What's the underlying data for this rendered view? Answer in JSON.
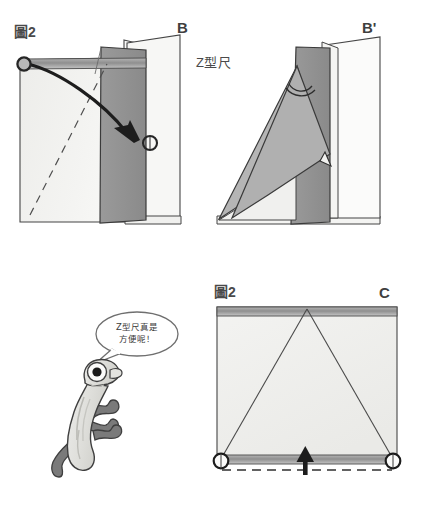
{
  "page": {
    "width": 428,
    "height": 508,
    "background": "#ffffff"
  },
  "labels": {
    "figure_top_left": "圖2",
    "step_b": "B",
    "step_b_prime": "B'",
    "z_ruler": "Z型尺",
    "figure_bottom_right": "圖2",
    "step_c": "C"
  },
  "speech_bubble": {
    "line1": "Z型尺真是",
    "line2": "方便呢！"
  },
  "colors": {
    "outline": "#3a3a3a",
    "paper_light": "#f2f2f0",
    "paper_white": "#fbfbfa",
    "flap_dark": "#8f8f8f",
    "flap_mid": "#a8a8a8",
    "band_gray": "#9a9a9a",
    "band_light": "#c9c9c9",
    "character_body": "#e2e2de",
    "character_leg": "#777777",
    "character_eye": "#1a1a1a",
    "arrow": "#222222"
  },
  "panels": {
    "top_left": {
      "name": "panel-b",
      "markers": [
        "pivot-circle-top-left",
        "pivot-circle-mid-right"
      ],
      "annotations": [
        "curved-rotation-arrow",
        "dashed-diagonal-fold-line",
        "horizontal-gray-band"
      ]
    },
    "top_right": {
      "name": "panel-b-prime",
      "annotations": [
        "folded-triangle-flap",
        "angle-arc-double",
        "small-arrow-head"
      ]
    },
    "bottom_right": {
      "name": "panel-c",
      "markers": [
        "corner-circle-left",
        "corner-circle-right"
      ],
      "annotations": [
        "triangle-fold-lines",
        "top-gray-band",
        "bottom-gray-band",
        "dashed-baseline",
        "up-arrow"
      ]
    }
  },
  "character": {
    "name": "worm-mascot",
    "features": [
      "single-large-eye",
      "curved-body",
      "three-legs"
    ]
  }
}
